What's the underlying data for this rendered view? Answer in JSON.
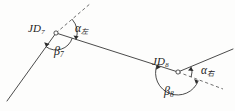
{
  "figure": {
    "type": "geometry-diagram",
    "width": 235,
    "height": 111,
    "background_color": "#fdfdfc",
    "stroke_color": "#2b2b2b",
    "text_color": "#222222"
  },
  "labels": {
    "vertex_left": {
      "base": "JD",
      "sub": "7",
      "x": 28,
      "y": 24
    },
    "vertex_right": {
      "base": "JD",
      "sub": "8",
      "x": 152,
      "y": 57
    },
    "alpha_left": {
      "base": "α",
      "sub": "左",
      "x": 74,
      "y": 24
    },
    "alpha_right": {
      "base": "α",
      "sub": "右",
      "x": 200,
      "y": 66
    },
    "beta_left": {
      "base": "β",
      "sub": "7",
      "x": 54,
      "y": 46
    },
    "beta_right": {
      "base": "β",
      "sub": "8",
      "x": 164,
      "y": 86
    }
  },
  "vertices": {
    "jd7": {
      "x": 56,
      "y": 33,
      "marker": "open-circle"
    },
    "jd8": {
      "x": 178,
      "y": 72,
      "marker": "open-circle"
    }
  },
  "lines": [
    {
      "name": "back-line-left",
      "style": "solid",
      "x1": 7,
      "y1": 101,
      "x2": 56,
      "y2": 33
    },
    {
      "name": "extension-left",
      "style": "dashed",
      "x1": 56,
      "y1": 33,
      "x2": 91,
      "y2": 3
    },
    {
      "name": "traverse-middle",
      "style": "solid",
      "x1": 56,
      "y1": 33,
      "x2": 178,
      "y2": 72
    },
    {
      "name": "forward-line-right",
      "style": "solid",
      "x1": 178,
      "y1": 72,
      "x2": 233,
      "y2": 49
    },
    {
      "name": "extension-right",
      "style": "dashed",
      "x1": 178,
      "y1": 72,
      "x2": 223,
      "y2": 89
    }
  ],
  "arcs": [
    {
      "name": "alpha-arc-left",
      "angle_label": "α左",
      "radius": 21
    },
    {
      "name": "beta-arc-left",
      "angle_label": "β₇",
      "radius": 17
    },
    {
      "name": "alpha-arc-right",
      "angle_label": "α右",
      "radius": 14
    },
    {
      "name": "beta-arc-right",
      "angle_label": "β₈",
      "radius": 22
    }
  ]
}
